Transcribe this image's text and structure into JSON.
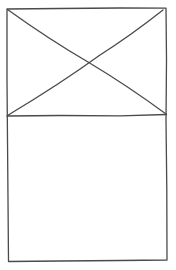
{
  "wireframe": {
    "type": "mobile-card-sketch",
    "stroke_color": "#4a4a4a",
    "background_color": "#ffffff",
    "sections": [
      {
        "name": "image-placeholder",
        "kind": "image",
        "marker": "crossed-box"
      },
      {
        "name": "content-area",
        "kind": "empty-block"
      }
    ]
  }
}
